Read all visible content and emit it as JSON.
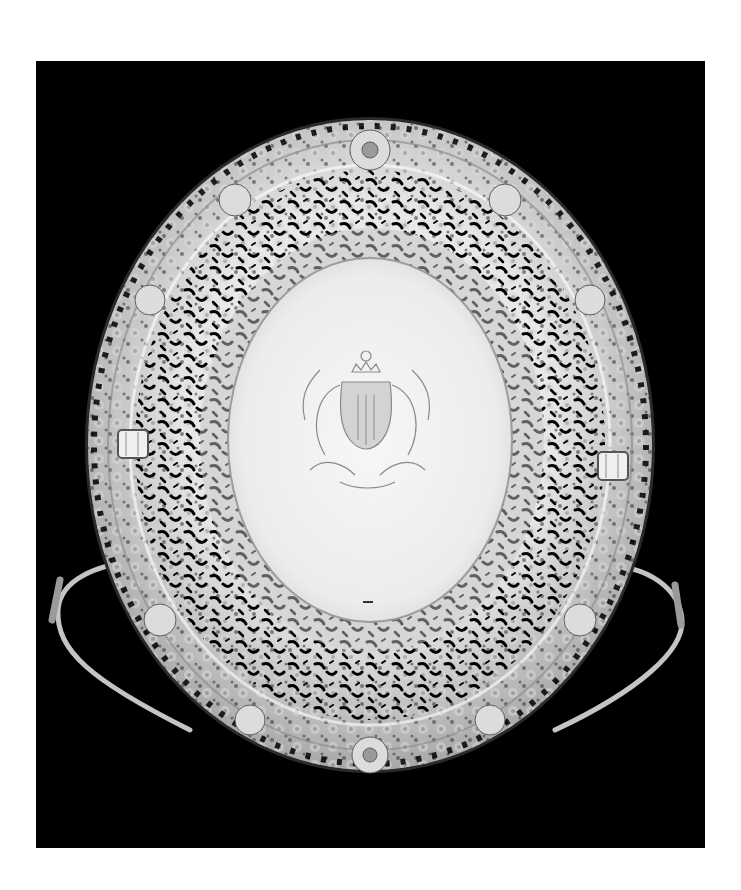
{
  "image": {
    "subject": "ornate pierced silver basket with engraved armorial crest",
    "background_color": "#000000",
    "page_color": "#ffffff",
    "silver_light": "#f2f2f2",
    "silver_mid": "#bdbdbd",
    "silver_dark": "#6e6e6e",
    "well_color": "#ececec"
  },
  "frame": {
    "x": 36,
    "y": 61,
    "width": 669,
    "height": 787
  },
  "dish": {
    "center": [
      370,
      445
    ],
    "outer_rx": 282,
    "outer_ry": 325,
    "inner_rx": 142,
    "inner_ry": 182,
    "handles": [
      "left",
      "right"
    ],
    "side_knops": [
      "left",
      "right"
    ]
  },
  "crest": {
    "center": [
      367,
      410
    ],
    "description": "engraved coat of arms with crown and foliate mantling"
  }
}
